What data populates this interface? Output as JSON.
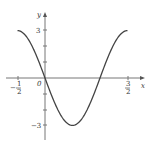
{
  "chart_data": {
    "type": "line",
    "title": "",
    "xlabel": "x",
    "ylabel": "y",
    "function": "y = -3 sin(pi x)",
    "xlim": [
      -0.5,
      1.5
    ],
    "ylim": [
      -3,
      3
    ],
    "grid": false,
    "x_tick_labels": [
      {
        "value": -0.5,
        "num": "1",
        "den": "2",
        "sign": "−"
      },
      {
        "value": 1.5,
        "num": "3",
        "den": "2",
        "sign": ""
      }
    ],
    "y_tick_labels": [
      {
        "value": 3,
        "label": "3"
      },
      {
        "value": -3,
        "label": "−3"
      }
    ],
    "origin_label": "0",
    "series": [
      {
        "name": "curve",
        "x": [
          -0.5,
          -0.25,
          0,
          0.25,
          0.5,
          0.75,
          1.0,
          1.25,
          1.5
        ],
        "y": [
          3,
          2.12,
          0,
          -2.12,
          -3,
          -2.12,
          0,
          2.12,
          3
        ]
      }
    ],
    "colors": {
      "curve": "#444444",
      "axis": "#777777"
    }
  }
}
